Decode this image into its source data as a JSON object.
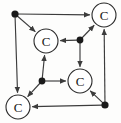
{
  "figure": {
    "kind": "directed-graph",
    "shape": "cube",
    "background_color": "#fdfdfc",
    "edge_color": "#3c3c3c",
    "node_stroke_color": "#2b2b2b",
    "node_fill_color": "#ffffff",
    "dot_color": "#1a1a1a",
    "label_color": "#1a1a1a"
  },
  "nodes": [
    {
      "id": "n-top-left",
      "type": "dot",
      "label": "",
      "cx": 15,
      "cy": 14,
      "r": 3.6
    },
    {
      "id": "n-top-right",
      "type": "circle",
      "label": "C",
      "cx": 104,
      "cy": 15,
      "r": 12
    },
    {
      "id": "n-bottom-left",
      "type": "circle",
      "label": "C",
      "cx": 18,
      "cy": 107,
      "r": 12
    },
    {
      "id": "n-bottom-right",
      "type": "dot",
      "label": "",
      "cx": 105,
      "cy": 105,
      "r": 3.6
    },
    {
      "id": "n-inner-tl",
      "type": "circle",
      "label": "C",
      "cx": 46,
      "cy": 41,
      "r": 12
    },
    {
      "id": "n-inner-tr",
      "type": "dot",
      "label": "",
      "cx": 80,
      "cy": 40,
      "r": 3.4
    },
    {
      "id": "n-inner-bl",
      "type": "dot",
      "label": "",
      "cx": 42,
      "cy": 81,
      "r": 3.4
    },
    {
      "id": "n-inner-br",
      "type": "circle",
      "label": "C",
      "cx": 80,
      "cy": 81,
      "r": 12
    }
  ],
  "edges": [
    {
      "id": "e-outer-top",
      "from": "n-top-left",
      "to": "n-top-right",
      "arrow": "to"
    },
    {
      "id": "e-outer-left",
      "from": "n-top-left",
      "to": "n-bottom-left",
      "arrow": "to"
    },
    {
      "id": "e-outer-right",
      "from": "n-bottom-right",
      "to": "n-top-right",
      "arrow": "to"
    },
    {
      "id": "e-outer-bottom",
      "from": "n-bottom-right",
      "to": "n-bottom-left",
      "arrow": "to"
    },
    {
      "id": "e-inner-top",
      "from": "n-inner-tr",
      "to": "n-inner-tl",
      "arrow": "to"
    },
    {
      "id": "e-inner-right",
      "from": "n-inner-tr",
      "to": "n-inner-br",
      "arrow": "to"
    },
    {
      "id": "e-inner-left",
      "from": "n-inner-bl",
      "to": "n-inner-tl",
      "arrow": "to"
    },
    {
      "id": "e-inner-bottom",
      "from": "n-inner-bl",
      "to": "n-inner-br",
      "arrow": "to"
    },
    {
      "id": "e-diag-tl",
      "from": "n-top-left",
      "to": "n-inner-tl",
      "arrow": "to"
    },
    {
      "id": "e-diag-tr",
      "from": "n-inner-tr",
      "to": "n-top-right",
      "arrow": "to"
    },
    {
      "id": "e-diag-bl",
      "from": "n-inner-bl",
      "to": "n-bottom-left",
      "arrow": "to"
    },
    {
      "id": "e-diag-br",
      "from": "n-bottom-right",
      "to": "n-inner-br",
      "arrow": "to"
    }
  ]
}
